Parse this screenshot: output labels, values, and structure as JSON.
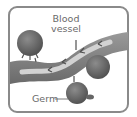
{
  "diagram": {
    "title": "",
    "labels": {
      "blood_line1": "Blood",
      "blood_line2": "vessel",
      "germ": "Germ"
    },
    "nodes": [
      {
        "id": "blood-vessel",
        "label": "Blood vessel",
        "shape": "wavy-band"
      },
      {
        "id": "germ-1",
        "label": "",
        "shape": "sphere"
      },
      {
        "id": "germ-2",
        "label": "",
        "shape": "sphere"
      },
      {
        "id": "germ-3",
        "label": "Germ",
        "shape": "sphere"
      }
    ],
    "colors": {
      "frame": "#8a8a8a",
      "vessel": "#7a7a7a",
      "vessel_inner": "#c8c8c8",
      "germ": "#6e6e6e",
      "text": "#6a6a6a"
    }
  }
}
